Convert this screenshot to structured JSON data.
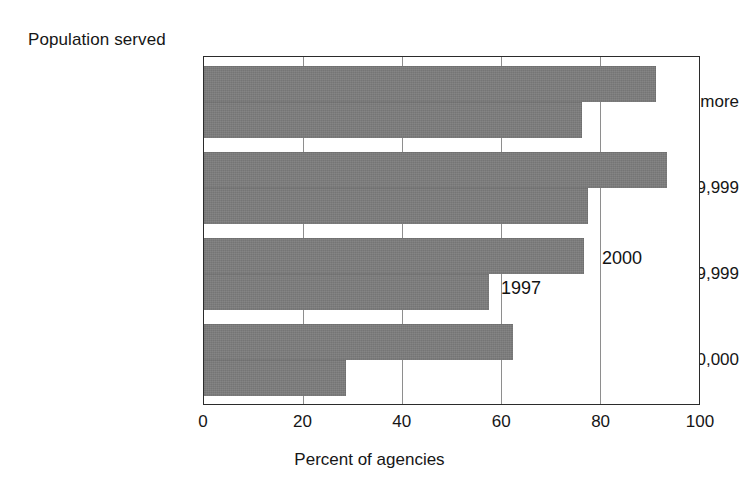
{
  "chart_data": {
    "type": "bar",
    "orientation": "horizontal",
    "title": "",
    "group_axis_title": "Population served",
    "xlabel": "Percent of agencies",
    "ylabel": "",
    "categories": [
      "250,000 or more",
      "50,000—249,999",
      "10,000—49,999",
      "Under 10,000"
    ],
    "series": [
      {
        "name": "2000",
        "values": [
          91,
          93,
          76,
          62
        ]
      },
      {
        "name": "1997",
        "values": [
          76,
          77,
          57,
          29
        ]
      }
    ],
    "xlim": [
      0,
      100
    ],
    "xticks": [
      0,
      20,
      40,
      60,
      80,
      100
    ],
    "xtick_labels": [
      "0",
      "20",
      "40",
      "60",
      "80",
      "100"
    ],
    "grid": "vertical",
    "legend": "inline-annotations",
    "bar_color": "#7d7d7d",
    "frame_color": "#2b2b2b",
    "gridline_color": "#8e8e8e"
  },
  "annotations": {
    "series_2000": "2000",
    "series_1997": "1997"
  }
}
